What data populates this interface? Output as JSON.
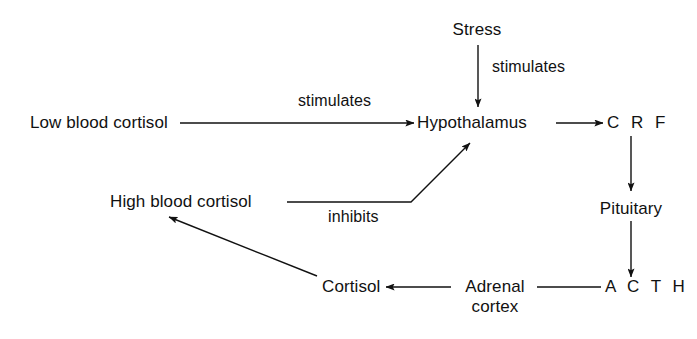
{
  "diagram": {
    "background_color": "#ffffff",
    "ink_color": "#111111",
    "nodes": [
      {
        "id": "stress",
        "label": "Stress"
      },
      {
        "id": "low_blood_cortisol",
        "label": "Low blood cortisol"
      },
      {
        "id": "hypothalamus",
        "label": "Hypothalamus"
      },
      {
        "id": "crf",
        "label": "C R F"
      },
      {
        "id": "pituitary",
        "label": "Pituitary"
      },
      {
        "id": "acth",
        "label": "A C T H"
      },
      {
        "id": "high_blood_cortisol",
        "label": "High blood cortisol"
      },
      {
        "id": "adrenal_cortex_l1",
        "label": "Adrenal"
      },
      {
        "id": "adrenal_cortex_l2",
        "label": "cortex"
      },
      {
        "id": "cortisol",
        "label": "Cortisol"
      }
    ],
    "edge_labels": [
      {
        "id": "stress_stimulates",
        "label": "stimulates"
      },
      {
        "id": "low_stimulates",
        "label": "stimulates"
      },
      {
        "id": "high_inhibits",
        "label": "inhibits"
      }
    ],
    "edges": [
      {
        "from": "stress",
        "to": "hypothalamus",
        "label": "stimulates",
        "arrow": "down"
      },
      {
        "from": "low_blood_cortisol",
        "to": "hypothalamus",
        "label": "stimulates",
        "arrow": "right"
      },
      {
        "from": "hypothalamus",
        "to": "crf",
        "label": "",
        "arrow": "right"
      },
      {
        "from": "crf",
        "to": "pituitary",
        "label": "",
        "arrow": "down"
      },
      {
        "from": "pituitary",
        "to": "acth",
        "label": "",
        "arrow": "down"
      },
      {
        "from": "acth",
        "to": "adrenal_cortex_l1",
        "label": "",
        "arrow": "none"
      },
      {
        "from": "adrenal_cortex_l1",
        "to": "cortisol",
        "label": "",
        "arrow": "left"
      },
      {
        "from": "cortisol",
        "to": "high_blood_cortisol",
        "label": "",
        "arrow": "up-left"
      },
      {
        "from": "high_blood_cortisol",
        "to": "hypothalamus",
        "label": "inhibits",
        "arrow": "up-right"
      }
    ]
  }
}
